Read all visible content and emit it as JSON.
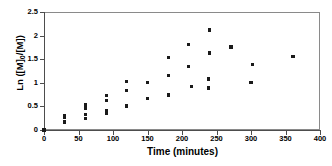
{
  "chart_data": {
    "type": "scatter",
    "title": "",
    "xlabel": "Time (minutes)",
    "ylabel": "Ln ([M]0/[M])",
    "ylabel_prefix": "Ln ([M]",
    "ylabel_sub": "0",
    "ylabel_suffix": "/[M])",
    "xlim": [
      0,
      400
    ],
    "ylim": [
      0,
      2.5
    ],
    "xticks": [
      0,
      50,
      100,
      150,
      200,
      250,
      300,
      350,
      400
    ],
    "xtick_labels": [
      "0",
      "50",
      "100",
      "150",
      "200",
      "250",
      "300",
      "350",
      "400"
    ],
    "yticks": [
      0,
      0.5,
      1,
      1.5,
      2,
      2.5
    ],
    "ytick_labels": [
      "0",
      "0.5",
      "1",
      "1.5",
      "2",
      "2.5"
    ],
    "grid": false,
    "legend": null,
    "marker": "filled-square",
    "marker_color": "#1a1a1a",
    "points": [
      {
        "x": 0,
        "y": 0.0
      },
      {
        "x": 30,
        "y": 0.17
      },
      {
        "x": 30,
        "y": 0.27
      },
      {
        "x": 30,
        "y": 0.3
      },
      {
        "x": 60,
        "y": 0.24
      },
      {
        "x": 60,
        "y": 0.33
      },
      {
        "x": 60,
        "y": 0.46
      },
      {
        "x": 60,
        "y": 0.53
      },
      {
        "x": 90,
        "y": 0.35
      },
      {
        "x": 90,
        "y": 0.41
      },
      {
        "x": 90,
        "y": 0.63
      },
      {
        "x": 90,
        "y": 0.73
      },
      {
        "x": 120,
        "y": 0.51
      },
      {
        "x": 120,
        "y": 0.83
      },
      {
        "x": 120,
        "y": 1.02
      },
      {
        "x": 150,
        "y": 0.66
      },
      {
        "x": 150,
        "y": 1.0
      },
      {
        "x": 180,
        "y": 0.74
      },
      {
        "x": 180,
        "y": 1.16
      },
      {
        "x": 180,
        "y": 1.53
      },
      {
        "x": 210,
        "y": 1.34
      },
      {
        "x": 210,
        "y": 1.81
      },
      {
        "x": 214,
        "y": 0.92
      },
      {
        "x": 238,
        "y": 0.89
      },
      {
        "x": 238,
        "y": 1.08
      },
      {
        "x": 240,
        "y": 1.63
      },
      {
        "x": 240,
        "y": 2.12
      },
      {
        "x": 271,
        "y": 1.76
      },
      {
        "x": 300,
        "y": 1.0
      },
      {
        "x": 302,
        "y": 1.39
      },
      {
        "x": 361,
        "y": 1.56
      }
    ]
  }
}
